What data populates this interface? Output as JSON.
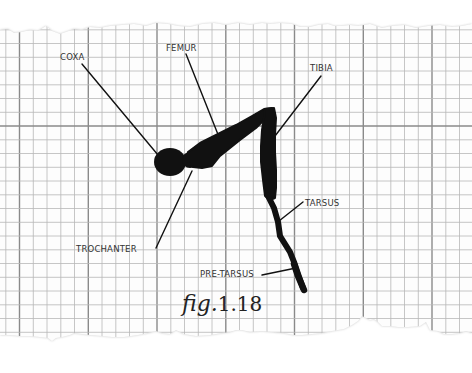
{
  "diagram": {
    "caption": {
      "prefix": "fig.",
      "number": "1.18"
    },
    "labels": [
      {
        "id": "coxa",
        "text": "COXA"
      },
      {
        "id": "femur",
        "text": "FEMUR"
      },
      {
        "id": "tibia",
        "text": "TIBIA"
      },
      {
        "id": "trochanter",
        "text": "TROCHANTER"
      },
      {
        "id": "tarsus",
        "text": "TARSUS"
      },
      {
        "id": "pre-tarsus",
        "text": "PRE-TARSUS"
      }
    ],
    "colors": {
      "paper": "#fdfdfd",
      "background": "#ffffff",
      "minor_grid": "#b8b8b8",
      "major_grid": "#8a8a8a",
      "ink": "#111111",
      "label_text": "#333333",
      "edge_shadow": "#c8c8c8"
    }
  }
}
